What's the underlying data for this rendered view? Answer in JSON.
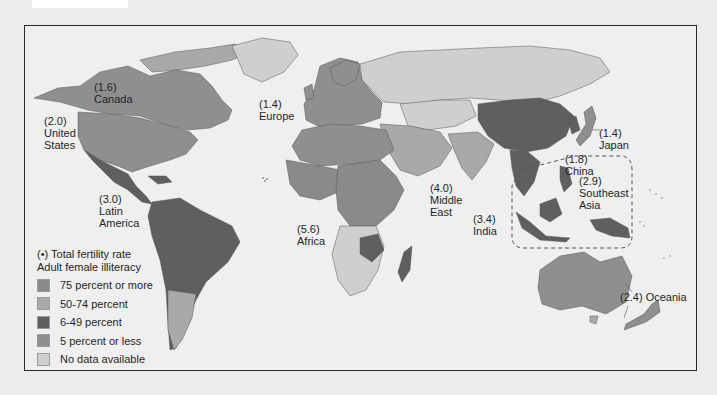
{
  "map": {
    "title": "Total fertility rate and adult female illiteracy by world region",
    "regions": [
      {
        "id": "canada",
        "rate": "(1.6)",
        "name": "Canada"
      },
      {
        "id": "united-states",
        "rate": "(2.0)",
        "name_line1": "United",
        "name_line2": "States"
      },
      {
        "id": "europe",
        "rate": "(1.4)",
        "name": "Europe"
      },
      {
        "id": "japan",
        "rate": "(1.4)",
        "name": "Japan"
      },
      {
        "id": "china",
        "rate": "(1.8)",
        "name": "China"
      },
      {
        "id": "southeast-asia",
        "rate": "(2.9)",
        "name_line1": "Southeast",
        "name_line2": "Asia"
      },
      {
        "id": "middle-east",
        "rate": "(4.0)",
        "name_line1": "Middle",
        "name_line2": "East"
      },
      {
        "id": "india",
        "rate": "(3.4)",
        "name": "India"
      },
      {
        "id": "latin-america",
        "rate": "(3.0)",
        "name_line1": "Latin",
        "name_line2": "America"
      },
      {
        "id": "africa",
        "rate": "(5.6)",
        "name": "Africa"
      },
      {
        "id": "oceania",
        "label": "(2.4) Oceania"
      }
    ]
  },
  "legend": {
    "line1": "(•) Total fertility rate",
    "line2": "Adult female illiteracy",
    "items": [
      {
        "label": "75 percent or more",
        "color": "#8a8a8a"
      },
      {
        "label": "50-74 percent",
        "color": "#a9a9a9"
      },
      {
        "label": "6-49 percent",
        "color": "#5f5f5f"
      },
      {
        "label": "5 percent or less",
        "color": "#8f8f8f"
      },
      {
        "label": "No data available",
        "color": "#cfcfcf"
      }
    ]
  },
  "colors": {
    "ocean": "#efefef",
    "frame": "#2a2a2a",
    "page_bg": "#ececec",
    "high": "#8a8a8a",
    "mid": "#a9a9a9",
    "low": "#5f5f5f",
    "verylow": "#8f8f8f",
    "nodata": "#cfcfcf"
  }
}
